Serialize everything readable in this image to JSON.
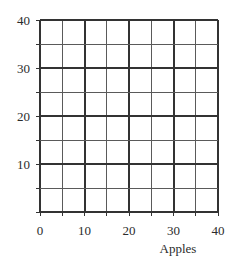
{
  "chart_data": {
    "type": "table",
    "title": "",
    "subtitle": "",
    "xlabel": "Apples",
    "ylabel": "",
    "xlim": [
      0,
      40
    ],
    "ylim": [
      0,
      40
    ],
    "grid": true,
    "legend": null,
    "series": [],
    "annotations": [],
    "x_ticks": {
      "labeled_values": [
        0,
        10,
        20,
        30,
        40
      ],
      "labels": [
        "0",
        "10",
        "20",
        "30",
        "40"
      ],
      "minor_values": [
        5,
        15,
        25,
        35
      ],
      "step": 5
    },
    "y_ticks": {
      "labeled_values": [
        10,
        20,
        30,
        40
      ],
      "labels": [
        "10",
        "20",
        "30",
        "40"
      ],
      "minor_values": [
        5,
        15,
        25,
        35
      ],
      "step": 5
    },
    "grid_lines": {
      "cell_size_units": 5,
      "columns": 8,
      "rows": 8,
      "minor_color": "#5a5a5a",
      "major_color": "#333333",
      "major_every_units": 10,
      "minor_width_px": 1,
      "major_width_px": 2
    },
    "colors": {
      "background": "#ffffff",
      "axis": "#333333",
      "text": "#2b2b2b",
      "gridline_minor": "#5a5a5a",
      "gridline_major": "#333333"
    }
  },
  "axes": {
    "x_title": "Apples",
    "x_tick_labels": [
      "0",
      "10",
      "20",
      "30",
      "40"
    ],
    "y_tick_labels": [
      "40",
      "30",
      "20",
      "10"
    ]
  }
}
